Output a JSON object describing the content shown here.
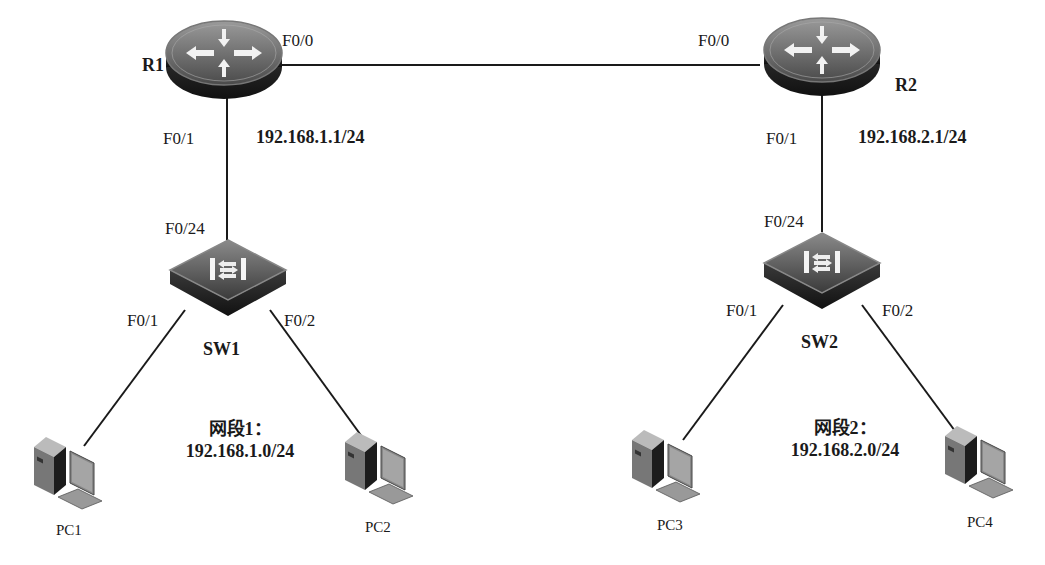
{
  "diagram": {
    "devices": {
      "R1": {
        "label": "R1",
        "type": "router",
        "ip": "192.168.1.1/24",
        "port_wan": "F0/0",
        "port_lan": "F0/1"
      },
      "R2": {
        "label": "R2",
        "type": "router",
        "ip": "192.168.2.1/24",
        "port_wan": "F0/0",
        "port_lan": "F0/1"
      },
      "SW1": {
        "label": "SW1",
        "type": "switch",
        "port_up": "F0/24",
        "port_a": "F0/1",
        "port_b": "F0/2"
      },
      "SW2": {
        "label": "SW2",
        "type": "switch",
        "port_up": "F0/24",
        "port_a": "F0/1",
        "port_b": "F0/2"
      },
      "PC1": {
        "label": "PC1",
        "type": "pc"
      },
      "PC2": {
        "label": "PC2",
        "type": "pc"
      },
      "PC3": {
        "label": "PC3",
        "type": "pc"
      },
      "PC4": {
        "label": "PC4",
        "type": "pc"
      }
    },
    "segments": [
      {
        "name": "网段1：",
        "network": "192.168.1.0/24"
      },
      {
        "name": "网段2：",
        "network": "192.168.2.0/24"
      }
    ],
    "links": [
      {
        "from": "R1:F0/0",
        "to": "R2:F0/0"
      },
      {
        "from": "R1:F0/1",
        "to": "SW1:F0/24"
      },
      {
        "from": "R2:F0/1",
        "to": "SW2:F0/24"
      },
      {
        "from": "SW1:F0/1",
        "to": "PC1"
      },
      {
        "from": "SW1:F0/2",
        "to": "PC2"
      },
      {
        "from": "SW2:F0/1",
        "to": "PC3"
      },
      {
        "from": "SW2:F0/2",
        "to": "PC4"
      }
    ]
  }
}
